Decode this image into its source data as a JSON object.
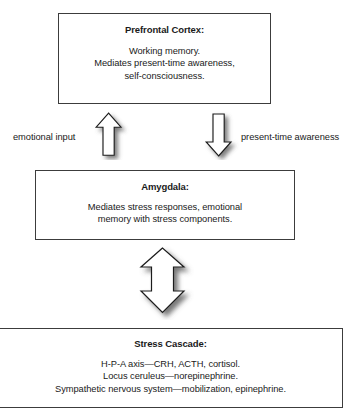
{
  "diagram": {
    "boxes": {
      "prefrontal": {
        "title": "Prefrontal Cortex:",
        "lines": [
          "Working memory.",
          "Mediates present-time awareness,",
          "self-consciousness."
        ]
      },
      "amygdala": {
        "title": "Amygdala:",
        "lines": [
          "Mediates stress responses, emotional",
          "memory with stress components."
        ]
      },
      "stress_cascade": {
        "title": "Stress Cascade:",
        "lines": [
          "H-P-A axis—CRH, ACTH, cortisol.",
          "Locus ceruleus—norepinephrine.",
          "Sympathetic nervous system—mobilization, epinephrine."
        ]
      }
    },
    "labels": {
      "emotional_input": "emotional input",
      "present_time_awareness": "present-time awareness"
    },
    "arrows": {
      "up": "arrow-up",
      "down": "arrow-down",
      "double": "arrow-double-headed-vertical"
    },
    "colors": {
      "box_border": "#3c3c3c",
      "arrow_outline": "#1a1a1a",
      "arrow_fill": "#ffffff",
      "text": "#1a1a1a",
      "background": "#ffffff"
    }
  }
}
